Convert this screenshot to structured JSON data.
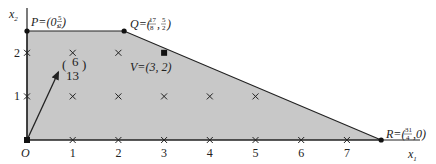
{
  "colors": {
    "region_fill": "#c8c8c8",
    "edge": "#222222",
    "background": "#ffffff"
  },
  "axes": {
    "x_label": "x",
    "x_label_sub": "1",
    "y_label": "x",
    "y_label_sub": "2",
    "origin_label": "O",
    "x_ticks": [
      "1",
      "2",
      "3",
      "4",
      "5",
      "6",
      "7"
    ],
    "y_ticks": [
      "1",
      "2"
    ],
    "x_range": [
      0,
      8.5
    ],
    "y_range": [
      0,
      2.9
    ]
  },
  "region": {
    "vertices": [
      [
        0,
        0
      ],
      [
        0,
        2.5
      ],
      [
        2.125,
        2.5
      ],
      [
        7.75,
        0
      ]
    ]
  },
  "vertices": [
    {
      "name": "P",
      "x": 0,
      "y": 2.5,
      "label_prefix": "P=(0,",
      "x_num": "",
      "x_den": "",
      "y_num": "5",
      "y_den": "2"
    },
    {
      "name": "Q",
      "x": 2.125,
      "y": 2.5,
      "label_prefix": "Q=(",
      "x_num": "17",
      "x_den": "8",
      "y_num": "5",
      "y_den": "2"
    },
    {
      "name": "R",
      "x": 7.75,
      "y": 0,
      "label_prefix": "R=(",
      "x_num": "31",
      "x_den": "4",
      "y_num": "",
      "y_den": ""
    }
  ],
  "optimal_point": {
    "name": "V",
    "x": 3,
    "y": 2,
    "label": "V=(3, 2)"
  },
  "lattice_points": [
    [
      1,
      0
    ],
    [
      2,
      0
    ],
    [
      3,
      0
    ],
    [
      4,
      0
    ],
    [
      5,
      0
    ],
    [
      6,
      0
    ],
    [
      7,
      0
    ],
    [
      0,
      1
    ],
    [
      1,
      1
    ],
    [
      2,
      1
    ],
    [
      3,
      1
    ],
    [
      4,
      1
    ],
    [
      5,
      1
    ],
    [
      0,
      2
    ],
    [
      1,
      2
    ],
    [
      2,
      2
    ]
  ],
  "objective_vector": {
    "x": 6,
    "y": 13,
    "top": "6",
    "bottom": "13"
  }
}
